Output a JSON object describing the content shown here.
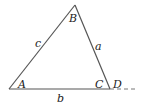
{
  "diagram": {
    "type": "triangle-with-exterior-extension",
    "colors": {
      "stroke": "#555555",
      "text": "#222222",
      "background": "#ffffff"
    },
    "vertices": {
      "A": {
        "label": "A",
        "x": 9,
        "y": 89
      },
      "B": {
        "label": "B",
        "x": 75,
        "y": 5
      },
      "C": {
        "label": "C",
        "x": 110,
        "y": 89
      }
    },
    "sides": {
      "a": {
        "label": "a",
        "from": "B",
        "to": "C"
      },
      "b": {
        "label": "b",
        "from": "A",
        "to": "C"
      },
      "c": {
        "label": "c",
        "from": "A",
        "to": "B"
      }
    },
    "extension": {
      "label": "D",
      "from_x": 110,
      "to_x": 138,
      "y": 89,
      "style": "dashed"
    },
    "labels": {
      "A": "A",
      "B": "B",
      "C": "C",
      "D": "D",
      "a": "a",
      "b": "b",
      "c": "c"
    }
  }
}
